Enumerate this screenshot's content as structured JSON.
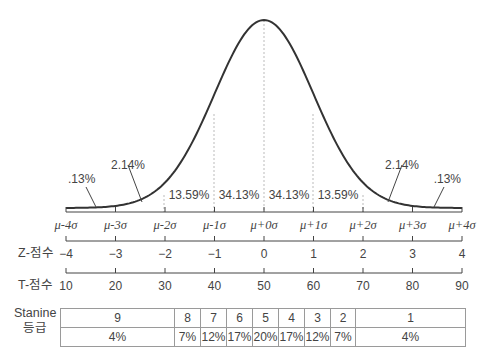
{
  "chart_data": {
    "type": "line",
    "title": "",
    "xlabel": "",
    "ylabel": "",
    "grid": false,
    "legend": null,
    "sigma_ticks": [
      "μ-4σ",
      "μ-3σ",
      "μ-2σ",
      "μ-1σ",
      "μ+0σ",
      "μ+1σ",
      "μ+2σ",
      "μ+3σ",
      "μ+4σ"
    ],
    "area_percentages": [
      {
        "range": "below -3σ",
        "value": ".13%"
      },
      {
        "range": "-3σ to -2σ",
        "value": "2.14%"
      },
      {
        "range": "-2σ to -1σ",
        "value": "13.59%"
      },
      {
        "range": "-1σ to 0σ",
        "value": "34.13%"
      },
      {
        "range": "0σ to +1σ",
        "value": "34.13%"
      },
      {
        "range": "+1σ to +2σ",
        "value": "13.59%"
      },
      {
        "range": "+2σ to +3σ",
        "value": "2.14%"
      },
      {
        "range": "above +3σ",
        "value": ".13%"
      }
    ],
    "z_scores": {
      "label": "Z-점수",
      "values": [
        "-4",
        "-3",
        "-2",
        "-1",
        "0",
        "1",
        "2",
        "3",
        "4"
      ]
    },
    "t_scores": {
      "label": "T-점수",
      "values": [
        "10",
        "20",
        "30",
        "40",
        "50",
        "60",
        "70",
        "80",
        "90"
      ]
    },
    "stanine": {
      "label_line1": "Stanine",
      "label_line2": "등급",
      "grades": [
        "9",
        "8",
        "7",
        "6",
        "5",
        "4",
        "3",
        "2",
        "1"
      ],
      "percents": [
        "4%",
        "7%",
        "12%",
        "17%",
        "20%",
        "17%",
        "12%",
        "7%",
        "4%"
      ]
    },
    "xlim": [
      -4,
      4
    ]
  }
}
